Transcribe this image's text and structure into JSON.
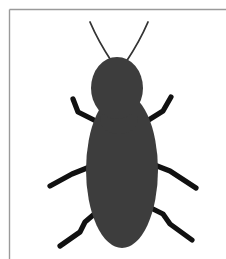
{
  "page": {
    "canvas_width": 226,
    "canvas_height": 259,
    "background_color": "#ffffff"
  },
  "frame": {
    "name": "page-border",
    "color": "#9a9a9a",
    "thickness": 1.4,
    "top_rule": {
      "x1": 9.5,
      "y1": 9.5,
      "x2": 226,
      "y2": 9.5
    },
    "left_rule": {
      "x1": 9.5,
      "y1": 9.5,
      "x2": 9.5,
      "y2": 259
    },
    "has_right_rule": false,
    "has_bottom_rule": false
  },
  "illustration": {
    "subject": "beetle",
    "body_color": "#3d3d3d",
    "appendage_color": "#111111",
    "antenna_color": "#333333",
    "antenna_stroke_width": 1.8,
    "leg_stroke_width": 5.2,
    "head": {
      "name": "insect-head",
      "shape": "ellipse",
      "cx": 117,
      "cy": 88,
      "rx": 26,
      "ry": 31
    },
    "abdomen": {
      "name": "insect-abdomen",
      "shape": "ellipse",
      "cx": 122,
      "cy": 170,
      "rx": 36,
      "ry": 78
    },
    "neck": {
      "name": "insect-thorax-joint",
      "shape": "ellipse",
      "cx": 119,
      "cy": 120,
      "rx": 19,
      "ry": 14
    },
    "antennae": [
      {
        "name": "antenna-left",
        "path": "M 112 62 C 104 50 96 36 90 22"
      },
      {
        "name": "antenna-right",
        "path": "M 126 62 C 134 50 142 36 148 22"
      }
    ],
    "legs": [
      {
        "name": "leg-front-left",
        "path": "M 96 121 L 78 112 L 73 99"
      },
      {
        "name": "leg-middle-left",
        "path": "M 92 166 L 72 174 L 50 186"
      },
      {
        "name": "leg-hind-left",
        "path": "M 99 210 L 85 222 L 80 232 L 60 246"
      },
      {
        "name": "leg-front-right",
        "path": "M 147 121 L 163 111 L 171 97"
      },
      {
        "name": "leg-middle-right",
        "path": "M 152 164 L 170 171 L 196 188"
      },
      {
        "name": "leg-hind-right",
        "path": "M 147 206 L 163 214 L 170 224 L 192 240"
      }
    ]
  },
  "alt_text": "Black and dark gray silhouette of a beetle with an oval head, two long curved antennae, a large oval abdomen, and six bent legs, drawn on a white page with a thin border rule along the top and left edges."
}
